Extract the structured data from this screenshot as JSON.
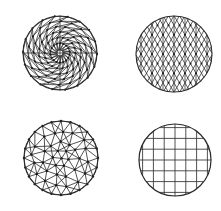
{
  "figure": {
    "width": 221,
    "height": 211,
    "background_color": "#ffffff",
    "line_color": "#333333",
    "node_color": "#1a1a1a",
    "boundary_color": "#2b2b2b"
  },
  "panels": [
    {
      "id": "panel-top-left",
      "name": "radial-spiral-triangular-mesh",
      "caption": "",
      "position": "top-left",
      "center": {
        "x": 60,
        "y": 53
      },
      "radius": 37,
      "mesh_type": "radial-triangular",
      "rings": 6,
      "sectors": 18,
      "twist_per_ring": 0.18,
      "center_hole_radius": 3.2,
      "center_hole_sides": 8,
      "show_nodes": true,
      "node_size": 1.1,
      "line_width": 0.8,
      "boundary_line_width": 1.1
    },
    {
      "id": "panel-top-right",
      "name": "structured-triangular-lattice",
      "caption": "",
      "position": "top-right",
      "center": {
        "x": 174,
        "y": 54
      },
      "radius": 38,
      "mesh_type": "structured-triangular",
      "cell_width": 11,
      "cell_height": 9.6,
      "families": [
        "vertical",
        "diagonal-up",
        "diagonal-down"
      ],
      "show_nodes": true,
      "node_size": 1.0,
      "line_width": 0.8,
      "boundary_line_width": 1.1
    },
    {
      "id": "panel-bottom-left",
      "name": "unstructured-delaunay-mesh",
      "caption": "",
      "position": "bottom-left",
      "center": {
        "x": 61,
        "y": 158
      },
      "radius": 37,
      "mesh_type": "unstructured-triangular",
      "boundary_nodes": 24,
      "interior_rings": [
        {
          "radius_fraction": 0.74,
          "count": 16,
          "jitter": 0.09
        },
        {
          "radius_fraction": 0.47,
          "count": 11,
          "jitter": 0.12
        },
        {
          "radius_fraction": 0.22,
          "count": 6,
          "jitter": 0.14
        },
        {
          "radius_fraction": 0.0,
          "count": 1,
          "jitter": 0.0
        }
      ],
      "show_nodes": true,
      "node_size": 1.2,
      "line_width": 0.85,
      "boundary_line_width": 1.1
    },
    {
      "id": "panel-bottom-right",
      "name": "structured-quadrilateral-grid",
      "caption": "",
      "position": "bottom-right",
      "center": {
        "x": 175,
        "y": 160
      },
      "radius": 36,
      "mesh_type": "structured-quadrilateral",
      "cell_width": 10.8,
      "cell_height": 10.8,
      "families": [
        "vertical",
        "horizontal"
      ],
      "show_nodes": false,
      "node_size": 0,
      "line_width": 0.85,
      "boundary_line_width": 1.2
    }
  ]
}
